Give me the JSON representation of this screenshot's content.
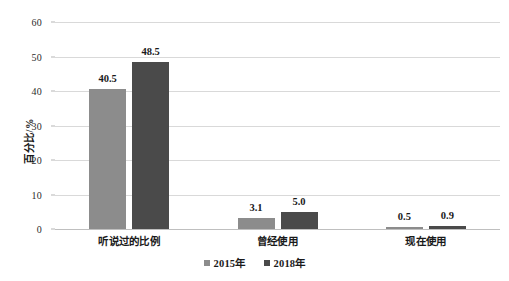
{
  "chart_data": {
    "type": "bar",
    "title": "",
    "xlabel": "",
    "ylabel": "百分比/%",
    "ylim": [
      0,
      60
    ],
    "yticks": [
      0,
      10,
      20,
      30,
      40,
      50,
      60
    ],
    "grid": true,
    "legend_position": "bottom-center",
    "categories": [
      "听说过的比例",
      "曾经使用",
      "现在使用"
    ],
    "series": [
      {
        "name": "2015年",
        "color": "#8c8c8c",
        "values": [
          40.5,
          3.1,
          0.5
        ],
        "labels": [
          "40.5",
          "3.1",
          "0.5"
        ]
      },
      {
        "name": "2018年",
        "color": "#4a4a4a",
        "values": [
          48.5,
          5.0,
          0.9
        ],
        "labels": [
          "48.5",
          "5.0",
          "0.9"
        ]
      }
    ]
  },
  "axis": {
    "y_tick_labels": [
      "60",
      "50",
      "40",
      "30",
      "20",
      "10",
      "0"
    ],
    "y_title": "百分比/%"
  },
  "legend": {
    "items": [
      {
        "label": "2015年",
        "color": "#8c8c8c"
      },
      {
        "label": "2018年",
        "color": "#4a4a4a"
      }
    ]
  },
  "colors": {
    "series_2015": "#8c8c8c",
    "series_2018": "#4a4a4a",
    "gridline": "#d9d9d9",
    "background": "#ffffff",
    "text": "#1a1a1a"
  }
}
